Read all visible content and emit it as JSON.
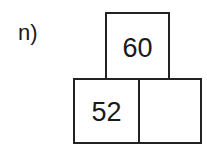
{
  "problem": {
    "label": "n)",
    "pyramid": {
      "top": "60",
      "bottom": [
        "52",
        ""
      ]
    }
  }
}
